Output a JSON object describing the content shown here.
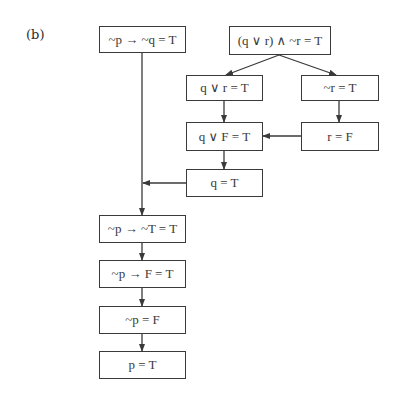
{
  "figure": {
    "label": "(b)"
  },
  "nodes": [
    {
      "id": "n1",
      "text": "~p → ~q = T"
    },
    {
      "id": "n2",
      "text": "(q ∨ r) ∧ ~r = T"
    },
    {
      "id": "n3",
      "text": "q ∨ r = T"
    },
    {
      "id": "n4",
      "text": "~r = T"
    },
    {
      "id": "n5",
      "text": "q ∨ F = T"
    },
    {
      "id": "n6",
      "text": "r = F"
    },
    {
      "id": "n7",
      "text": "q = T"
    },
    {
      "id": "n8",
      "text": "~p → ~T = T"
    },
    {
      "id": "n9",
      "text": "~p → F = T"
    },
    {
      "id": "n10",
      "text": "~p = F"
    },
    {
      "id": "n11",
      "text": "p = T"
    }
  ],
  "edges": [
    {
      "from": "n2",
      "to": "n3"
    },
    {
      "from": "n2",
      "to": "n4"
    },
    {
      "from": "n3",
      "to": "n5"
    },
    {
      "from": "n4",
      "to": "n6"
    },
    {
      "from": "n6",
      "to": "n5"
    },
    {
      "from": "n5",
      "to": "n7"
    },
    {
      "from": "n7",
      "to": "n1-line"
    },
    {
      "from": "n1",
      "to": "n8"
    },
    {
      "from": "n8",
      "to": "n9"
    },
    {
      "from": "n9",
      "to": "n10"
    },
    {
      "from": "n10",
      "to": "n11"
    }
  ],
  "colors": {
    "line": "#3a3a3a",
    "background": "#ffffff"
  }
}
